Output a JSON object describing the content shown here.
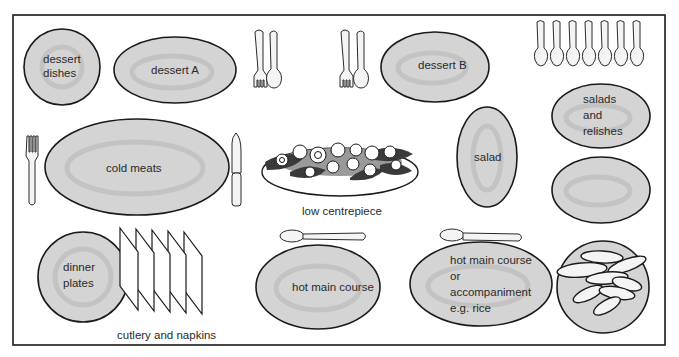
{
  "diagram": {
    "colors": {
      "plate_fill": "#d4d4d4",
      "outline": "#1a1a1a",
      "text": "#2a2a2a",
      "background": "#ffffff"
    },
    "items": {
      "dessert_dishes": [
        "dessert",
        "dishes"
      ],
      "dessert_a": "dessert A",
      "dessert_b": "dessert B",
      "salads_relishes": [
        "salads",
        "and",
        "relishes"
      ],
      "cold_meats": "cold meats",
      "low_centrepiece": "low centrepiece",
      "salad": "salad",
      "dinner_plates": [
        "dinner",
        "plates"
      ],
      "cutlery_napkins": "cutlery and napkins",
      "hot_main_course": "hot main course",
      "hot_main_or_accompaniment": [
        "hot main course",
        "or",
        "accompaniment",
        "e.g. rice"
      ]
    },
    "icons": [
      "fork-icon",
      "spoon-icon",
      "knife-icon",
      "serving-spoon-icon",
      "napkin-icon",
      "flower-centrepiece-icon",
      "bread-rolls-icon"
    ]
  }
}
